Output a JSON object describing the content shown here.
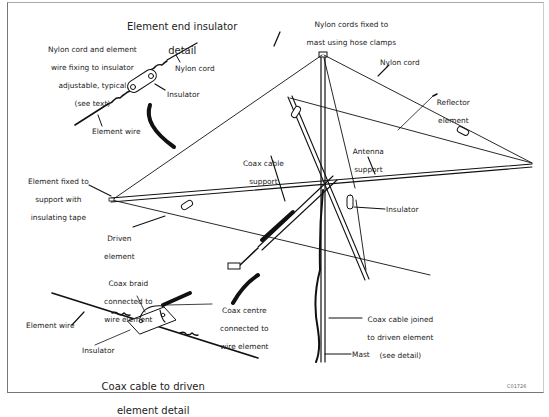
{
  "diagram": {
    "type": "antenna construction diagram",
    "reference_code": "C01726"
  },
  "detail_end_insulator": {
    "title_line1": "Element end insulator",
    "title_line2": "detail",
    "note_line1": "Nylon cord and element",
    "note_line2": "wire fixing to insulator",
    "note_line3": "adjustable, typical",
    "note_line4": "(see text)",
    "nylon_cord": "Nylon cord",
    "insulator": "Insulator",
    "element_wire": "Element wire"
  },
  "main": {
    "mast_top_line1": "Nylon cords fixed to",
    "mast_top_line2": "mast using hose clamps",
    "nylon_cord": "Nylon cord",
    "reflector_line1": "Reflector",
    "reflector_line2": "element",
    "antenna_support_line1": "Antenna",
    "antenna_support_line2": "support",
    "coax_support_line1": "Coax cable",
    "coax_support_line2": "support",
    "element_fixed_line1": "Element fixed to",
    "element_fixed_line2": "support with",
    "element_fixed_line3": "insulating tape",
    "driven_line1": "Driven",
    "driven_line2": "element",
    "insulator": "Insulator",
    "coax_joined_line1": "Coax cable joined",
    "coax_joined_line2": "to driven element",
    "coax_joined_line3": "(see detail)",
    "mast": "Mast"
  },
  "detail_coax": {
    "braid_line1": "Coax braid",
    "braid_line2": "connected to",
    "braid_line3": "wire element",
    "centre_line1": "Coax centre",
    "centre_line2": "connected to",
    "centre_line3": "wire element",
    "element_wire": "Element wire",
    "insulator": "Insulator",
    "title_line1": "Coax cable to driven",
    "title_line2": "element detail"
  }
}
